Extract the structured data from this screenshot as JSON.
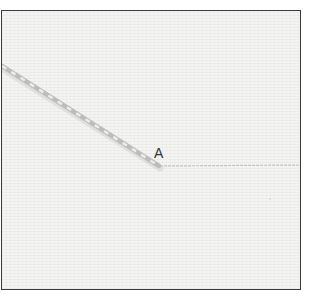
{
  "diagram": {
    "label_a": "A",
    "colors": {
      "border": "#3a3a3a",
      "fabric": "#f4f4f3",
      "thread": "#b8b8b8",
      "thread_highlight": "#e8e8e8",
      "fine_line": "#c8c8c8",
      "label": "#333333"
    }
  }
}
